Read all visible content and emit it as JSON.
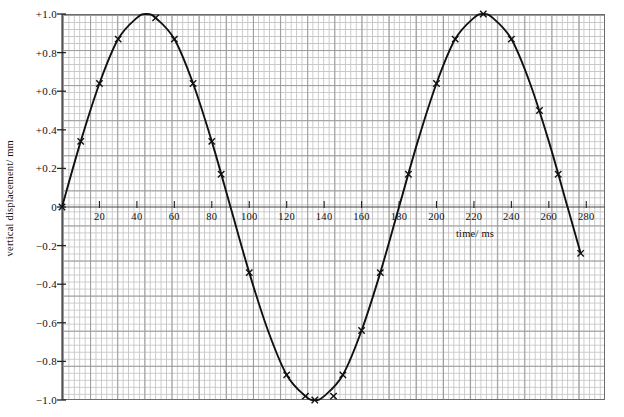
{
  "chart_data": {
    "type": "line",
    "title": "",
    "subtitle": "",
    "xlabel": "time/ ms",
    "ylabel": "vertical displacement/ mm",
    "xlim": [
      0,
      290
    ],
    "ylim": [
      -1.0,
      1.0
    ],
    "grid": true,
    "grid_style": "graph-paper minor 2ms / 0.04mm, major 10ms / 0.2mm",
    "legend": "none",
    "x_ticks": [
      20,
      40,
      60,
      80,
      100,
      120,
      140,
      160,
      180,
      200,
      220,
      240,
      260,
      280
    ],
    "x_tick_labels": [
      "20",
      "40",
      "60",
      "80",
      "100",
      "120",
      "140",
      "160",
      "180",
      "200",
      "220",
      "240",
      "260",
      "280"
    ],
    "y_ticks": [
      1.0,
      0.8,
      0.6,
      0.4,
      0.2,
      0.0,
      -0.2,
      -0.4,
      -0.6,
      -0.8,
      -1.0
    ],
    "y_tick_labels": [
      "+1.0",
      "+0.8",
      "+0.6",
      "+0.4",
      "+0.2",
      "0",
      "-0.2",
      "-0.4",
      "-0.6",
      "-0.8",
      "-1.0"
    ],
    "series": [
      {
        "name": "vertical displacement",
        "marker": "cross",
        "line_color": "#111111",
        "period_ms": 180,
        "amplitude_mm": 1.0,
        "x": [
          0,
          10,
          20,
          30,
          40,
          45,
          50,
          60,
          70,
          80,
          90,
          100,
          110,
          120,
          130,
          135,
          140,
          150,
          160,
          170,
          180,
          190,
          200,
          210,
          220,
          225,
          230,
          240,
          250,
          260,
          270,
          277
        ],
        "y": [
          0.0,
          0.34,
          0.64,
          0.87,
          0.98,
          1.0,
          0.98,
          0.87,
          0.64,
          0.34,
          0.0,
          -0.34,
          -0.64,
          -0.87,
          -0.98,
          -1.0,
          -0.98,
          -0.87,
          -0.64,
          -0.34,
          0.0,
          0.34,
          0.64,
          0.87,
          0.98,
          1.0,
          0.98,
          0.87,
          0.64,
          0.34,
          0.0,
          -0.24
        ],
        "marker_points": [
          {
            "x": 0,
            "y": 0.0
          },
          {
            "x": 10,
            "y": 0.34
          },
          {
            "x": 20,
            "y": 0.64
          },
          {
            "x": 30,
            "y": 0.87
          },
          {
            "x": 50,
            "y": 0.98
          },
          {
            "x": 60,
            "y": 0.87
          },
          {
            "x": 70,
            "y": 0.64
          },
          {
            "x": 80,
            "y": 0.34
          },
          {
            "x": 85,
            "y": 0.17
          },
          {
            "x": 100,
            "y": -0.34
          },
          {
            "x": 120,
            "y": -0.87
          },
          {
            "x": 130,
            "y": -0.98
          },
          {
            "x": 135,
            "y": -1.0
          },
          {
            "x": 145,
            "y": -0.98
          },
          {
            "x": 150,
            "y": -0.87
          },
          {
            "x": 160,
            "y": -0.64
          },
          {
            "x": 170,
            "y": -0.34
          },
          {
            "x": 185,
            "y": 0.17
          },
          {
            "x": 200,
            "y": 0.64
          },
          {
            "x": 210,
            "y": 0.87
          },
          {
            "x": 225,
            "y": 1.0
          },
          {
            "x": 240,
            "y": 0.87
          },
          {
            "x": 255,
            "y": 0.5
          },
          {
            "x": 265,
            "y": 0.17
          },
          {
            "x": 277,
            "y": -0.24
          }
        ]
      }
    ]
  },
  "axis": {
    "y_title": "vertical displacement/ mm",
    "x_title": "time/ ms"
  }
}
